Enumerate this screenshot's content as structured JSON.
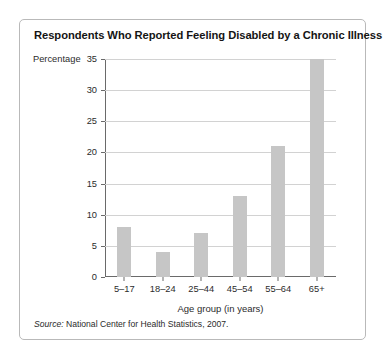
{
  "card": {
    "title": "Respondents Who Reported Feeling Disabled by a Chronic Illness",
    "source_prefix": "Source:",
    "source_text": " National Center for Health Statistics, 2007."
  },
  "chart_data": {
    "type": "bar",
    "title": "Respondents Who Reported Feeling Disabled by a Chronic Illness",
    "categories": [
      "5–17",
      "18–24",
      "25–44",
      "45–54",
      "55–64",
      "65+"
    ],
    "values": [
      8,
      4,
      7,
      13,
      21,
      35
    ],
    "xlabel": "Age group (in years)",
    "ylabel": "Percentage",
    "ylim": [
      0,
      35
    ],
    "yticks": [
      0,
      5,
      10,
      15,
      20,
      25,
      30,
      35
    ],
    "ytick_labels": [
      "0",
      "5",
      "10",
      "15",
      "20",
      "25",
      "30",
      "35"
    ],
    "grid": true,
    "legend": "none",
    "bar_color": "#c6c6c6",
    "source": "Source: National Center for Health Statistics, 2007."
  }
}
